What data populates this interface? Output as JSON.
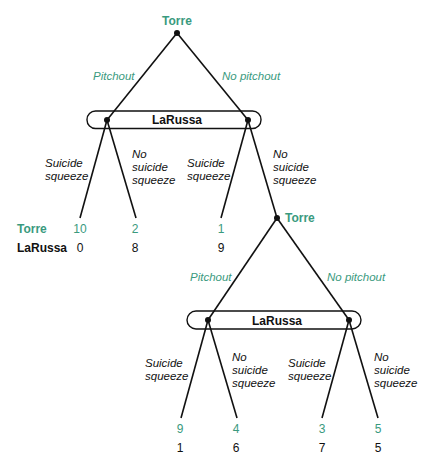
{
  "colors": {
    "player1": "#3a9a7e",
    "player2": "#111111",
    "lines": "#111111"
  },
  "players": {
    "p1": "Torre",
    "p2": "LaRussa"
  },
  "tree": {
    "root": {
      "label": "Torre",
      "actions": {
        "left": "Pitchout",
        "right": "No pitchout"
      }
    },
    "infoset1": {
      "label": "LaRussa",
      "left_node_actions": {
        "left": [
          "Suicide",
          "squeeze"
        ],
        "right": [
          "No",
          "suicide",
          "squeeze"
        ]
      },
      "right_node_actions": {
        "left": [
          "Suicide",
          "squeeze"
        ],
        "right": [
          "No",
          "suicide",
          "squeeze"
        ]
      }
    },
    "node2": {
      "label": "Torre",
      "actions": {
        "left": "Pitchout",
        "right": "No pitchout"
      }
    },
    "infoset2": {
      "label": "LaRussa",
      "left_node_actions": {
        "left": [
          "Suicide",
          "squeeze"
        ],
        "right": [
          "No",
          "suicide",
          "squeeze"
        ]
      },
      "right_node_actions": {
        "left": [
          "Suicide",
          "squeeze"
        ],
        "right": [
          "No",
          "suicide",
          "squeeze"
        ]
      }
    }
  },
  "payoff_row_labels": {
    "p1": "Torre",
    "p2": "LaRussa"
  },
  "payoffs_level1": [
    {
      "p1": "10",
      "p2": "0"
    },
    {
      "p1": "2",
      "p2": "8"
    },
    {
      "p1": "1",
      "p2": "9"
    }
  ],
  "payoffs_level2": [
    {
      "p1": "9",
      "p2": "1"
    },
    {
      "p1": "4",
      "p2": "6"
    },
    {
      "p1": "3",
      "p2": "7"
    },
    {
      "p1": "5",
      "p2": "5"
    }
  ]
}
